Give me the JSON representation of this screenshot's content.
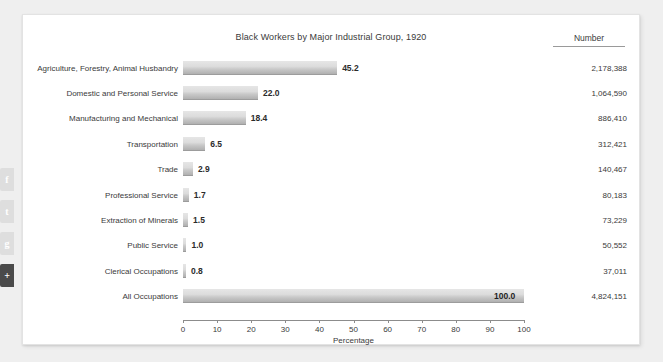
{
  "card": {
    "number_column_header": "Number"
  },
  "social": {
    "buttons": [
      {
        "name": "facebook-share",
        "glyph": "f",
        "dark": false
      },
      {
        "name": "twitter-share",
        "glyph": "t",
        "dark": false
      },
      {
        "name": "google-share",
        "glyph": "g",
        "dark": false
      },
      {
        "name": "more-share",
        "glyph": "+",
        "dark": true
      }
    ]
  },
  "chart_data": {
    "type": "bar",
    "orientation": "horizontal",
    "title": "Black Workers by Major Industrial Group, 1920",
    "xlabel": "Percentage",
    "ylabel": "",
    "xlim": [
      0,
      100
    ],
    "xticks": [
      0,
      10,
      20,
      30,
      40,
      50,
      60,
      70,
      80,
      90,
      100
    ],
    "grid": false,
    "legend": "none",
    "value_format": "one-decimal",
    "categories": [
      "Agriculture, Forestry, Animal Husbandry",
      "Domestic and Personal Service",
      "Manufacturing and Mechanical",
      "Transportation",
      "Trade",
      "Professional Service",
      "Extraction of Minerals",
      "Public Service",
      "Clerical Occupations",
      "All Occupations"
    ],
    "values": [
      45.2,
      22.0,
      18.4,
      6.5,
      2.9,
      1.7,
      1.5,
      1.0,
      0.8,
      100.0
    ],
    "value_labels": [
      "45.2",
      "22.0",
      "18.4",
      "6.5",
      "2.9",
      "1.7",
      "1.5",
      "1.0",
      "0.8",
      "100.0"
    ],
    "numbers": [
      "2,178,388",
      "1,064,590",
      "886,410",
      "312,421",
      "140,467",
      "80,183",
      "73,229",
      "50,552",
      "37,011",
      "4,824,151"
    ],
    "rows": [
      {
        "category": "Agriculture, Forestry, Animal Husbandry",
        "percentage": 45.2,
        "value_label": "45.2",
        "number": "2,178,388"
      },
      {
        "category": "Domestic and Personal Service",
        "percentage": 22.0,
        "value_label": "22.0",
        "number": "1,064,590"
      },
      {
        "category": "Manufacturing and Mechanical",
        "percentage": 18.4,
        "value_label": "18.4",
        "number": "886,410"
      },
      {
        "category": "Transportation",
        "percentage": 6.5,
        "value_label": "6.5",
        "number": "312,421"
      },
      {
        "category": "Trade",
        "percentage": 2.9,
        "value_label": "2.9",
        "number": "140,467"
      },
      {
        "category": "Professional Service",
        "percentage": 1.7,
        "value_label": "1.7",
        "number": "80,183"
      },
      {
        "category": "Extraction of Minerals",
        "percentage": 1.5,
        "value_label": "1.5",
        "number": "73,229"
      },
      {
        "category": "Public Service",
        "percentage": 1.0,
        "value_label": "1.0",
        "number": "50,552"
      },
      {
        "category": "Clerical Occupations",
        "percentage": 0.8,
        "value_label": "0.8",
        "number": "37,011"
      },
      {
        "category": "All Occupations",
        "percentage": 100.0,
        "value_label": "100.0",
        "number": "4,824,151"
      }
    ]
  },
  "colors": {
    "bar_light": "#dcdcdc",
    "bar_dark": "#b0b0b0",
    "text": "#3a3a3a",
    "card_bg": "#ffffff",
    "page_bg": "#efefef"
  }
}
